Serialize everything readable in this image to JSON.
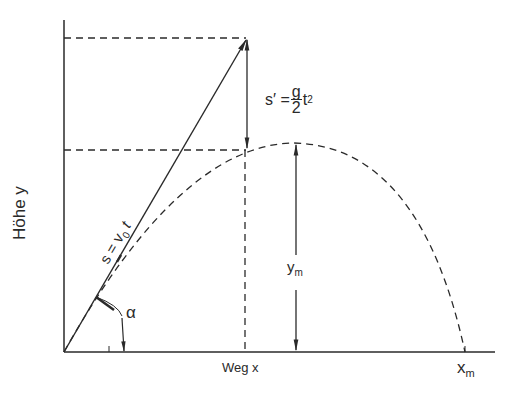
{
  "diagram": {
    "type": "projectile-motion",
    "labels": {
      "y_axis": "Höhe y",
      "x_axis": "Weg x",
      "x_max": "x",
      "x_max_sub": "m",
      "y_max": "y",
      "y_max_sub": "m",
      "angle": "α",
      "velocity_eq_s": "s = v",
      "velocity_eq_sub": "0",
      "velocity_eq_t": " t",
      "fall_eq_lhs": "s′ = ",
      "fall_eq_num": "g",
      "fall_eq_den": "2",
      "fall_eq_t": "t",
      "fall_eq_exp": "2"
    },
    "colors": {
      "line": "#2a2a2a",
      "background": "#ffffff"
    }
  }
}
